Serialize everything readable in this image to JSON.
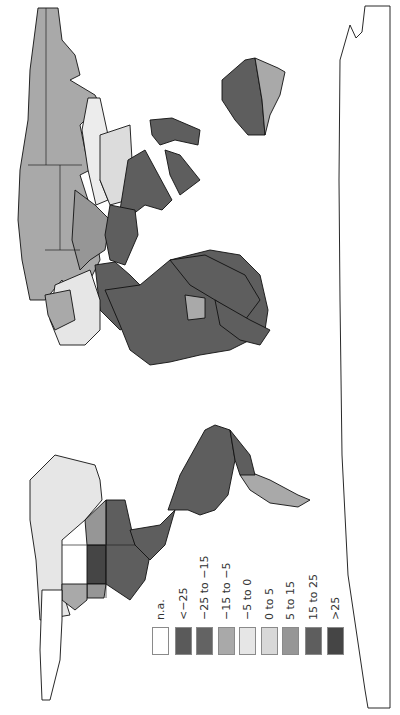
{
  "map": {
    "projection": "world map rotated 90° clockwise (north at left)",
    "regions": [
      {
        "name": "Greenland",
        "class": "n.a."
      },
      {
        "name": "Canada",
        "class": "-5 to 0"
      },
      {
        "name": "Alaska",
        "class": "-5 to 0"
      },
      {
        "name": "USA North-Central",
        "class": ">25"
      },
      {
        "name": "USA East",
        "class": "15 to 25"
      },
      {
        "name": "USA West",
        "class": "5 to 15"
      },
      {
        "name": "USA Southwest",
        "class": "-15 to -5"
      },
      {
        "name": "Mexico/Central America",
        "class": "15 to 25"
      },
      {
        "name": "South America North",
        "class": "15 to 25"
      },
      {
        "name": "Argentina",
        "class": "-15 to -5"
      },
      {
        "name": "Russia North",
        "class": "-15 to -5"
      },
      {
        "name": "Russia Far East",
        "class": "-15 to -5"
      },
      {
        "name": "Russia Central",
        "class": "-15 to -5"
      },
      {
        "name": "Kazakhstan/Central Asia",
        "class": "5 to 15"
      },
      {
        "name": "Mongolia",
        "class": "-5 to 0"
      },
      {
        "name": "China North",
        "class": "0 to 5"
      },
      {
        "name": "China South",
        "class": "15 to 25"
      },
      {
        "name": "India",
        "class": "15 to 25"
      },
      {
        "name": "Middle East",
        "class": "15 to 25"
      },
      {
        "name": "Saudi Arabia",
        "class": "n.a."
      },
      {
        "name": "North Africa",
        "class": "15 to 25"
      },
      {
        "name": "Central Africa",
        "class": "15 to 25"
      },
      {
        "name": "Sudan/Ethiopia",
        "class": "-15 to -5"
      },
      {
        "name": "Southern Africa",
        "class": "15 to 25"
      },
      {
        "name": "Europe",
        "class": "-5 to 0"
      },
      {
        "name": "Scandinavia",
        "class": "-15 to -5"
      },
      {
        "name": "Australia West",
        "class": "15 to 25"
      },
      {
        "name": "Australia East",
        "class": "-15 to -5"
      },
      {
        "name": "Southeast Asia",
        "class": "15 to 25"
      },
      {
        "name": "Antarctica",
        "class": "outline"
      }
    ]
  },
  "legend": {
    "items": [
      {
        "label": "n.a.",
        "color": "#ffffff"
      },
      {
        "label": "<−25",
        "color": "#5a5a5a"
      },
      {
        "label": "−25 to −15",
        "color": "#636363"
      },
      {
        "label": "−15 to −5",
        "color": "#a9a9a9"
      },
      {
        "label": "−5 to 0",
        "color": "#e6e6e6"
      },
      {
        "label": "0 to 5",
        "color": "#d8d8d8"
      },
      {
        "label": "5 to 15",
        "color": "#969696"
      },
      {
        "label": "15 to 25",
        "color": "#5e5e5e"
      },
      {
        "label": ">25",
        "color": "#454545"
      }
    ]
  }
}
